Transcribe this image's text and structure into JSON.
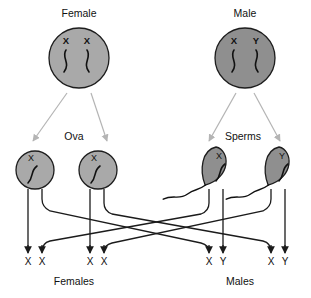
{
  "diagram": {
    "colors": {
      "female_cell_fill": "#a9a9a9",
      "male_cell_fill": "#8f8f8f",
      "gamete_fill": "#a9a9a9",
      "sperm_fill": "#8f8f8f",
      "outline": "#1d1d1d",
      "meiosis_arrow": "#b4b4b4",
      "fertilization_line": "#1b1b1b",
      "background": "#ffffff",
      "text": "#111111"
    },
    "parents": [
      {
        "name": "female-parent",
        "label": "Female",
        "label_x": 79,
        "label_y": 17,
        "cx": 79,
        "cy": 58,
        "r": 30,
        "fill_key": "female_cell_fill",
        "chromosomes": [
          {
            "letter": "X",
            "letter_x": 66,
            "letter_y": 44
          },
          {
            "letter": "X",
            "letter_y": 44,
            "letter_x": 87
          }
        ]
      },
      {
        "name": "male-parent",
        "label": "Male",
        "label_x": 245,
        "label_y": 17,
        "cx": 245,
        "cy": 58,
        "r": 30,
        "fill_key": "male_cell_fill",
        "chromosomes": [
          {
            "letter": "X",
            "letter_x": 234,
            "letter_y": 44
          },
          {
            "letter": "Y",
            "letter_x": 256,
            "letter_y": 44
          }
        ]
      }
    ],
    "gamete_group_labels": [
      {
        "name": "ova-label",
        "label": "Ova",
        "x": 74,
        "y": 140
      },
      {
        "name": "sperms-label",
        "label": "Sperms",
        "x": 243,
        "y": 140
      }
    ],
    "gametes": [
      {
        "name": "ovum-1",
        "type": "ovum",
        "cx": 35,
        "cy": 170,
        "rx": 19,
        "ry": 19,
        "letter": "X",
        "letter_x": 31,
        "letter_y": 161
      },
      {
        "name": "ovum-2",
        "type": "ovum",
        "cx": 98,
        "cy": 170,
        "rx": 19,
        "ry": 19,
        "letter": "X",
        "letter_x": 94,
        "letter_y": 161
      },
      {
        "name": "sperm-1",
        "type": "sperm",
        "cx": 216,
        "cy": 168,
        "rx": 15,
        "ry": 21,
        "letter": "X",
        "letter_x": 219,
        "letter_y": 159
      },
      {
        "name": "sperm-2",
        "type": "sperm",
        "cx": 279,
        "cy": 168,
        "rx": 15,
        "ry": 21,
        "letter": "Y",
        "letter_x": 282,
        "letter_y": 159
      }
    ],
    "meiosis_arrows": [
      {
        "name": "female-meiosis-left",
        "x1": 67,
        "y1": 93,
        "x2": 33,
        "y2": 141
      },
      {
        "name": "female-meiosis-right",
        "x1": 91,
        "y1": 93,
        "x2": 107,
        "y2": 141
      },
      {
        "name": "male-meiosis-left",
        "x1": 236,
        "y1": 93,
        "x2": 209,
        "y2": 141
      },
      {
        "name": "male-meiosis-right",
        "x1": 254,
        "y1": 93,
        "x2": 280,
        "y2": 141
      }
    ],
    "offspring": [
      {
        "name": "offspring-1",
        "letter": "X",
        "x": 28,
        "y": 265,
        "arrow_tip_y": 253
      },
      {
        "name": "offspring-2",
        "letter": "X",
        "x": 42,
        "y": 265,
        "arrow_tip_y": 253
      },
      {
        "name": "offspring-3",
        "letter": "X",
        "x": 90,
        "y": 265,
        "arrow_tip_y": 253
      },
      {
        "name": "offspring-4",
        "letter": "X",
        "x": 104,
        "y": 265,
        "arrow_tip_y": 253
      },
      {
        "name": "offspring-5",
        "letter": "X",
        "x": 209,
        "y": 265,
        "arrow_tip_y": 253
      },
      {
        "name": "offspring-6",
        "letter": "Y",
        "x": 223,
        "y": 265,
        "arrow_tip_y": 253
      },
      {
        "name": "offspring-7",
        "letter": "X",
        "x": 271,
        "y": 265,
        "arrow_tip_y": 253
      },
      {
        "name": "offspring-8",
        "letter": "Y",
        "x": 285,
        "y": 265,
        "arrow_tip_y": 253
      }
    ],
    "offspring_group_labels": [
      {
        "name": "females-label",
        "label": "Females",
        "x": 74,
        "y": 285
      },
      {
        "name": "males-label",
        "label": "Males",
        "x": 240,
        "y": 285
      }
    ],
    "fertilization_paths": [
      {
        "name": "ovum1-to-offspring1",
        "source": "ovum-1",
        "target": "offspring-1",
        "d": "M28,189 L28,248"
      },
      {
        "name": "ovum1-to-offspring5",
        "source": "ovum-1",
        "target": "offspring-5",
        "d": "M42,189 L42,199 Q42,207 50,211 L201,243 Q209,245 209,252"
      },
      {
        "name": "ovum2-to-offspring3",
        "source": "ovum-2",
        "target": "offspring-3",
        "d": "M90,189 L90,248"
      },
      {
        "name": "ovum2-to-offspring7",
        "source": "ovum-2",
        "target": "offspring-7",
        "d": "M104,189 L104,203 Q104,211 112,214 L263,241 Q271,243 271,252"
      },
      {
        "name": "sperm1-to-offspring2",
        "source": "sperm-1",
        "target": "offspring-2",
        "d": "M209,189 L209,203 Q209,211 201,214 L50,241 Q42,243 42,252"
      },
      {
        "name": "sperm1-to-offspring6",
        "source": "sperm-1",
        "target": "offspring-6",
        "d": "M223,189 L223,248"
      },
      {
        "name": "sperm2-to-offspring4",
        "source": "sperm-2",
        "target": "offspring-4",
        "d": "M271,189 L271,199 Q271,207 263,211 L112,243 Q104,245 104,252"
      },
      {
        "name": "sperm2-to-offspring8",
        "source": "sperm-2",
        "target": "offspring-8",
        "d": "M285,189 L285,248"
      }
    ]
  }
}
